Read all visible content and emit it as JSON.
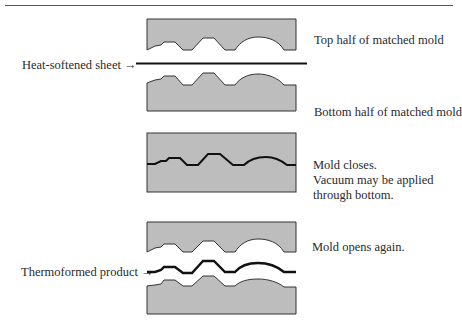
{
  "diagram": {
    "colors": {
      "mold_fill": "#bdbdbd",
      "mold_stroke": "#333333",
      "sheet": "#111111"
    },
    "labels": {
      "top_mold": "Top half of matched mold",
      "sheet": "Heat-softened sheet →",
      "bottom_mold": "Bottom half of matched mold",
      "closed_line1": "Mold closes.",
      "closed_line2": "Vacuum may be applied",
      "closed_line3": "through bottom.",
      "opens": "Mold opens again.",
      "product": "Thermoformed product →"
    },
    "stages": [
      {
        "name": "open-before",
        "items": [
          "top-mold",
          "heat-softened-sheet",
          "bottom-mold"
        ]
      },
      {
        "name": "closed",
        "items": [
          "closed-mold",
          "formed-sheet"
        ]
      },
      {
        "name": "open-after",
        "items": [
          "top-mold",
          "thermoformed-product",
          "bottom-mold"
        ]
      }
    ]
  }
}
